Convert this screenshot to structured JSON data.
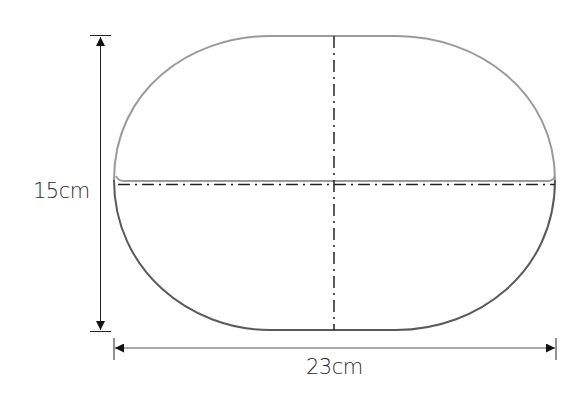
{
  "diagram": {
    "title": "",
    "shape": "rounded oval (stadium) with horizontal seam",
    "dimensions": {
      "height": {
        "label": "15cm",
        "value": 15,
        "unit": "cm"
      },
      "width": {
        "label": "23cm",
        "value": 23,
        "unit": "cm"
      }
    },
    "colors": {
      "outline_top": "#9a9a9a",
      "outline_bottom": "#5a5a5a",
      "dimension_line": "#222222",
      "center_line": "#222222",
      "text": "#2a2a2a"
    }
  }
}
